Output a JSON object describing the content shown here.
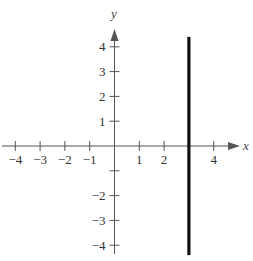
{
  "chart_data": {
    "type": "line",
    "title": "",
    "xlabel": "x",
    "ylabel": "y",
    "xlim": [
      -4.5,
      5
    ],
    "ylim": [
      -4.5,
      4.6
    ],
    "grid": false,
    "x_ticks": [
      -4,
      -3,
      -2,
      -1,
      1,
      2,
      4
    ],
    "x_tick_labels": [
      "−4",
      "−3",
      "−2",
      "−1",
      "1",
      "2",
      "4"
    ],
    "y_ticks": [
      4,
      3,
      2,
      1,
      -1,
      -2,
      -3,
      -4
    ],
    "y_tick_labels": [
      "4",
      "3",
      "2",
      "1",
      "",
      "−2",
      "−3",
      "−4"
    ],
    "series": [
      {
        "name": "x = 3",
        "description": "vertical line",
        "x": [
          3,
          3
        ],
        "y": [
          -4.4,
          4.4
        ],
        "color": "#111111"
      }
    ]
  },
  "axes": {
    "x_label": "x",
    "y_label": "y",
    "axis_color": "#555555",
    "line_color": "#111111"
  }
}
